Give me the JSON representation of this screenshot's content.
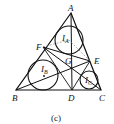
{
  "figure": {
    "caption": "(c)",
    "points": {
      "A": {
        "label": "A",
        "x": 71,
        "y": 13
      },
      "B": {
        "label": "B",
        "x": 16,
        "y": 90
      },
      "C": {
        "label": "C",
        "x": 101,
        "y": 90
      },
      "D": {
        "label": "D",
        "x": 72,
        "y": 90
      },
      "E": {
        "label": "E",
        "x": 90,
        "y": 61
      },
      "F": {
        "label": "F",
        "x": 43,
        "y": 47
      },
      "G": {
        "label": "G",
        "x": 70,
        "y": 55
      }
    },
    "circles": [
      {
        "label": "I",
        "sub": "A",
        "cx": 69,
        "cy": 40,
        "r": 14
      },
      {
        "label": "I",
        "sub": "B",
        "cx": 43,
        "cy": 75,
        "r": 15
      },
      {
        "label": "I",
        "sub": "C",
        "cx": 89,
        "cy": 80,
        "r": 9
      }
    ],
    "stroke_color": "#111111"
  }
}
